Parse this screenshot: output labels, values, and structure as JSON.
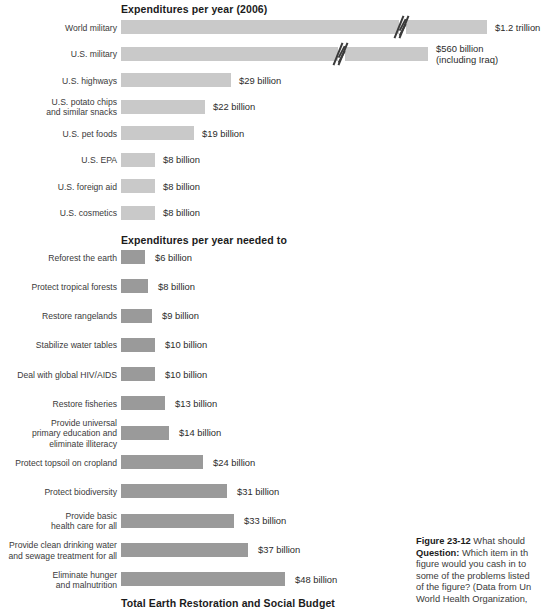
{
  "figure": {
    "headings": {
      "top": "Expenditures per year (2006)",
      "middle": "Expenditures per year needed to",
      "bottom": "Total Earth Restoration and Social Budget"
    },
    "caption": {
      "label": "Figure 23-12",
      "lead": " What should",
      "question_label": "Question:",
      "lines": [
        " Which item in th",
        "figure would you cash in to ",
        "some of the problems listed ",
        "of the figure? (Data from Un",
        "World Health Organization,"
      ]
    }
  },
  "chart_data": {
    "type": "bar",
    "title": "Expenditures per year (2006)",
    "xlabel": "",
    "ylabel": "",
    "orientation": "horizontal",
    "grid": false,
    "legend": false,
    "units": "US dollars per year",
    "panels": [
      {
        "name": "expenditures-2006",
        "title": "Expenditures per year (2006)",
        "bar_color": "#c9c9c9",
        "categories": [
          "World military",
          "U.S. military",
          "U.S. highways",
          "U.S. potato chips\nand similar snacks",
          "U.S. pet foods",
          "U.S. EPA",
          "U.S. foreign aid",
          "U.S. cosmetics"
        ],
        "values": [
          1200,
          560,
          29,
          22,
          19,
          8,
          8,
          8
        ],
        "value_labels": [
          "$1.2 trillion",
          "$560 billion\n(including Iraq)",
          "$29 billion",
          "$22 billion",
          "$19 billion",
          "$8 billion",
          "$8 billion",
          "$8 billion"
        ],
        "axis_break": [
          true,
          true,
          false,
          false,
          false,
          false,
          false,
          false
        ]
      },
      {
        "name": "expenditures-needed",
        "title": "Expenditures per year needed to",
        "bar_color": "#9a9a9a",
        "categories": [
          "Reforest the earth",
          "Protect tropical forests",
          "Restore rangelands",
          "Stabilize water tables",
          "Deal with global HIV/AIDS",
          "Restore fisheries",
          "Provide universal\nprimary education and\neliminate illiteracy",
          "Protect topsoil on cropland",
          "Protect biodiversity",
          "Provide basic\nhealth care for all",
          "Provide clean drinking water\nand sewage treatment for all",
          "Eliminate hunger\nand malnutrition"
        ],
        "values": [
          6,
          8,
          9,
          10,
          10,
          13,
          14,
          24,
          31,
          33,
          37,
          48
        ],
        "value_labels": [
          "$6 billion",
          "$8 billion",
          "$9 billion",
          "$10 billion",
          "$10 billion",
          "$13 billion",
          "$14 billion",
          "$24 billion",
          "$31 billion",
          "$33 billion",
          "$37 billion",
          "$48 billion"
        ],
        "axis_break": [
          false,
          false,
          false,
          false,
          false,
          false,
          false,
          false,
          false,
          false,
          false,
          false
        ]
      }
    ]
  },
  "colors": {
    "bar_light": "#c9c9c9",
    "bar_dark": "#9a9a9a",
    "text": "#2b2b2b",
    "background": "#ffffff"
  }
}
